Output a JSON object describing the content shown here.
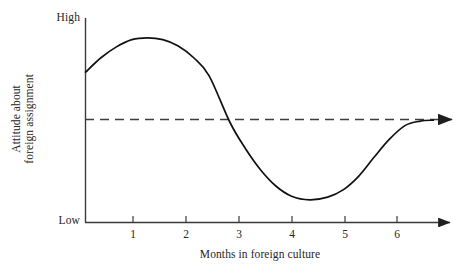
{
  "chart_data": {
    "type": "line",
    "title": "",
    "subtitle": "",
    "xlabel": "Months in foreign culture",
    "ylabel": "Attitude about foreign assignment",
    "ylabel_lines": [
      "Attitude about",
      "foreign assignment"
    ],
    "y_axis_tick_labels": [
      "High",
      "Low"
    ],
    "y_high_label": "High",
    "y_low_label": "Low",
    "x_tick_labels": [
      "1",
      "2",
      "3",
      "4",
      "5",
      "6"
    ],
    "xlim": [
      0,
      6.9
    ],
    "ylim_labels": [
      "Low",
      "High"
    ],
    "grid": false,
    "legend_position": "none",
    "series": [
      {
        "name": "Attitude about foreign assignment",
        "style": "solid",
        "color": "#111111",
        "x": [
          0,
          0.3,
          0.6,
          0.9,
          1.2,
          1.5,
          1.8,
          2.1,
          2.4,
          2.8,
          3.1,
          3.4,
          3.7,
          4.0,
          4.35,
          4.7,
          5.0,
          5.3,
          5.6,
          5.9,
          6.2,
          6.5,
          6.75
        ],
        "y": [
          0.775,
          0.855,
          0.915,
          0.955,
          0.965,
          0.955,
          0.92,
          0.855,
          0.755,
          0.5,
          0.355,
          0.235,
          0.145,
          0.09,
          0.07,
          0.085,
          0.125,
          0.2,
          0.305,
          0.405,
          0.48,
          0.505,
          0.51
        ]
      },
      {
        "name": "Reference level",
        "style": "dashed",
        "color": "#3d3d3d",
        "x": [
          0,
          6.9
        ],
        "y": [
          0.5,
          0.5
        ]
      }
    ],
    "annotations": [
      {
        "name": "peak",
        "x": 1.2,
        "y_label": "near High",
        "description": "honeymoon peak"
      },
      {
        "name": "crossing",
        "x": 2.8,
        "y_label": "reference level",
        "description": "curve crosses reference line"
      },
      {
        "name": "trough",
        "x": 4.35,
        "y_label": "near Low",
        "description": "culture shock trough"
      },
      {
        "name": "recovery",
        "x": 6.75,
        "y_label": "reference level",
        "description": "adjustment back to reference level"
      }
    ],
    "axis_arrows": {
      "x_axis": true,
      "reference_line": true
    }
  },
  "colors": {
    "background": "#ffffff",
    "axis": "#3a3a3a",
    "curve": "#111111",
    "dashed_line": "#3d3d3d",
    "text": "#262626"
  }
}
